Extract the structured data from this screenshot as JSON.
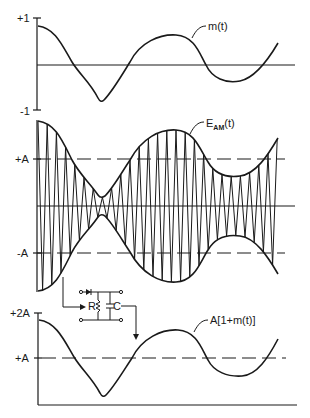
{
  "figure": {
    "panels": [
      {
        "id": "message",
        "y_ticks": [
          "+1",
          "-1"
        ],
        "curve_label": "m(t)"
      },
      {
        "id": "am",
        "y_ticks": [
          "+A",
          "-A"
        ],
        "curve_label_main": "E",
        "curve_label_sub": "AM",
        "curve_label_tail": "(t)"
      },
      {
        "id": "demod",
        "y_ticks": [
          "+2A",
          "+A"
        ],
        "curve_label": "A[1+m(t)]"
      }
    ],
    "detector": {
      "resistor_label": "R",
      "capacitor_label": "C",
      "components": [
        "diode",
        "resistor",
        "capacitor"
      ]
    },
    "message_samples": {
      "t": [
        0,
        0.1,
        0.2,
        0.3,
        0.4,
        0.5,
        0.6,
        0.7,
        0.8,
        0.9,
        1.0
      ],
      "m": [
        0.85,
        0.55,
        0.0,
        -0.5,
        -0.85,
        0.0,
        0.6,
        0.65,
        0.0,
        -0.38,
        0.5
      ]
    }
  }
}
